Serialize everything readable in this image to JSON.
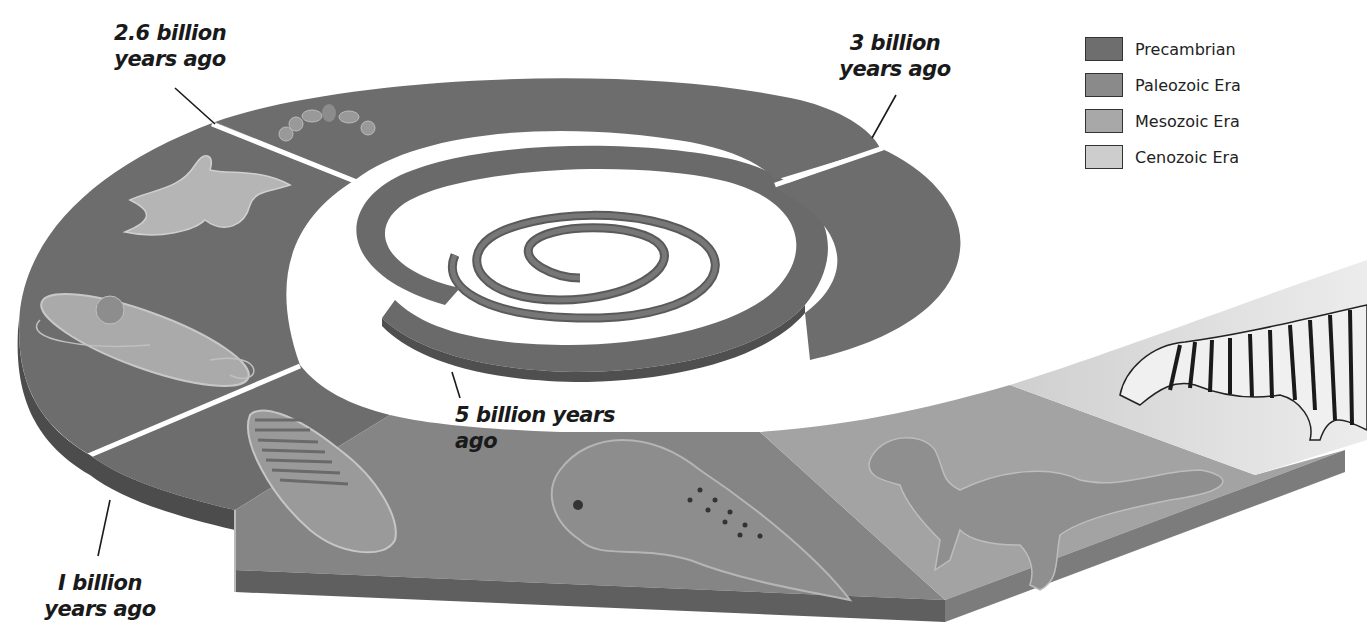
{
  "diagram": {
    "type": "geologic-time-spiral",
    "labels": {
      "t_2_6": {
        "line1": "2.6 billion",
        "line2": "years ago"
      },
      "t_3": {
        "line1": "3 billion",
        "line2": "years ago"
      },
      "t_5": {
        "text": "5 billion years ago"
      },
      "t_1": {
        "line1": "I billion",
        "line2": "years ago"
      }
    },
    "legend": [
      {
        "label": "Precambrian",
        "color": "#6e6e6e"
      },
      {
        "label": "Paleozoic Era",
        "color": "#8a8a8a"
      },
      {
        "label": "Mesozoic Era",
        "color": "#a8a8a8"
      },
      {
        "label": "Cenozoic Era",
        "color": "#cdcdcd"
      }
    ],
    "organisms": [
      {
        "name": "bacteria-chain",
        "era": "Precambrian"
      },
      {
        "name": "amoeba",
        "era": "Precambrian"
      },
      {
        "name": "euglena",
        "era": "Precambrian"
      },
      {
        "name": "trilobite",
        "era": "Paleozoic Era"
      },
      {
        "name": "coelacanth-fish",
        "era": "Paleozoic Era"
      },
      {
        "name": "tyrannosaur-dinosaur",
        "era": "Mesozoic Era"
      },
      {
        "name": "zebra",
        "era": "Cenozoic Era"
      }
    ]
  }
}
